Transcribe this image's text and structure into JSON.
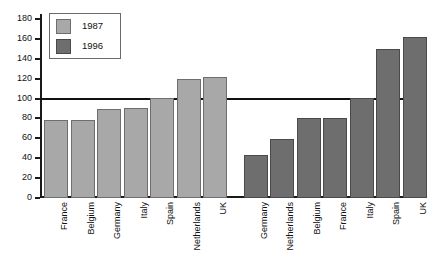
{
  "chart_data": {
    "type": "bar",
    "title": "",
    "subtitle": "",
    "xlabel": "",
    "ylabel": "",
    "ylim": [
      0,
      180
    ],
    "yticks": [
      0,
      20,
      40,
      60,
      80,
      100,
      120,
      140,
      160,
      180
    ],
    "grid": false,
    "legend_position": "top-left",
    "reference_line": {
      "value": 100,
      "color": "#111111"
    },
    "groups": [
      {
        "series": "1987",
        "color": "#a8a8a8",
        "categories": [
          "France",
          "Belgium",
          "Germany",
          "Italy",
          "Spain",
          "Netherlands",
          "UK"
        ],
        "values": [
          78,
          78,
          90,
          91,
          101,
          120,
          122
        ]
      },
      {
        "series": "1996",
        "color": "#6e6e6e",
        "categories": [
          "Germany",
          "Netherlands",
          "Belgium",
          "France",
          "Italy",
          "Spain",
          "UK"
        ],
        "values": [
          43,
          59,
          80,
          80,
          101,
          150,
          162
        ]
      }
    ],
    "bars": [
      {
        "label": "France",
        "series": "1987",
        "value": 78
      },
      {
        "label": "Belgium",
        "series": "1987",
        "value": 78
      },
      {
        "label": "Germany",
        "series": "1987",
        "value": 90
      },
      {
        "label": "Italy",
        "series": "1987",
        "value": 91
      },
      {
        "label": "Spain",
        "series": "1987",
        "value": 101
      },
      {
        "label": "Netherlands",
        "series": "1987",
        "value": 120
      },
      {
        "label": "UK",
        "series": "1987",
        "value": 122
      },
      {
        "label": "Germany",
        "series": "1996",
        "value": 43
      },
      {
        "label": "Netherlands",
        "series": "1996",
        "value": 59
      },
      {
        "label": "Belgium",
        "series": "1996",
        "value": 80
      },
      {
        "label": "France",
        "series": "1996",
        "value": 80
      },
      {
        "label": "Italy",
        "series": "1996",
        "value": 101
      },
      {
        "label": "Spain",
        "series": "1996",
        "value": 150
      },
      {
        "label": "UK",
        "series": "1996",
        "value": 162
      }
    ]
  },
  "legend": {
    "entries": [
      {
        "label": "1987",
        "color": "#a8a8a8"
      },
      {
        "label": "1996",
        "color": "#6e6e6e"
      }
    ]
  },
  "axis": {
    "y_tick_labels": [
      "180",
      "160",
      "140",
      "120",
      "100",
      "80",
      "60",
      "40",
      "20",
      "0"
    ]
  },
  "colors": {
    "series_1987": "#a8a8a8",
    "series_1996": "#6e6e6e",
    "axis": "#1a1a1a",
    "reference_line": "#111111",
    "background": "#ffffff"
  }
}
